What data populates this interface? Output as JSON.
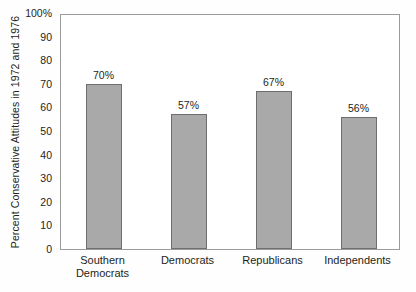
{
  "chart_data": {
    "type": "bar",
    "title": "",
    "xlabel": "",
    "ylabel": "Percent Conservative Attitudes in 1972 and 1976",
    "ylim": [
      0,
      100
    ],
    "yticks": [
      0,
      10,
      20,
      30,
      40,
      50,
      60,
      70,
      80,
      90,
      100
    ],
    "ytick_labels": [
      "0",
      "10",
      "20",
      "30",
      "40",
      "50",
      "60",
      "70",
      "80",
      "90",
      "100%"
    ],
    "grid": false,
    "legend": null,
    "categories": [
      "Southern Democrats",
      "Democrats",
      "Republicans",
      "Independents"
    ],
    "category_lines": [
      [
        "Southern",
        "Democrats"
      ],
      [
        "Democrats"
      ],
      [
        "Republicans"
      ],
      [
        "Independents"
      ]
    ],
    "values": [
      70,
      57,
      67,
      56
    ],
    "data_labels": [
      "70%",
      "57%",
      "67%",
      "56%"
    ],
    "colors": {
      "bar_fill": "#a9a9a9",
      "bar_stroke": "#6e6e6e",
      "axis": "#9b9b9b",
      "text": "#231f20",
      "background": "#fefefe",
      "plot_background": "#ffffff"
    }
  }
}
